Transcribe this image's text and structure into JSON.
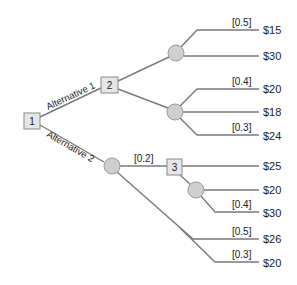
{
  "diagram": {
    "type": "decision-tree",
    "decision_nodes": [
      {
        "id": "1",
        "label": "1"
      },
      {
        "id": "2",
        "label": "2"
      },
      {
        "id": "3",
        "label": "3"
      }
    ],
    "alternatives": [
      {
        "label": "Alternative 1",
        "from": "1",
        "to": "2"
      },
      {
        "label": "Alternative 2",
        "from": "1",
        "to": "chance-c"
      }
    ],
    "probabilities": {
      "a_top": "[0.5]",
      "b_top": "[0.4]",
      "b_bottom": "[0.3]",
      "c_to_3": "[0.2]",
      "d_bottom": "[0.4]",
      "c_mid": "[0.5]",
      "c_bottom": "[0.3]"
    },
    "payoffs": {
      "a1": "$15",
      "a2": "$30",
      "b1": "$20",
      "b2": "$18",
      "b3": "$24",
      "n3_top": "$25",
      "d1": "$20",
      "d2": "$30",
      "c2": "$26",
      "c3": "$20"
    }
  }
}
